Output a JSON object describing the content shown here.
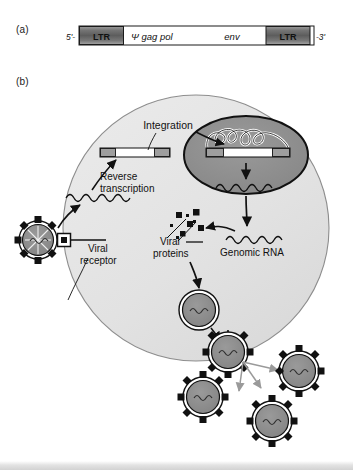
{
  "figure": {
    "panels": [
      {
        "id": "a",
        "label": "(a)",
        "caption_type": "provirus-genome-map"
      },
      {
        "id": "b",
        "label": "(b)",
        "caption_type": "retroviral-life-cycle"
      }
    ]
  },
  "genome_map": {
    "five_prime": "5'-",
    "three_prime": "-3'",
    "segments": [
      {
        "name": "ltr-left",
        "label": "LTR",
        "style": "gradient-gray"
      },
      {
        "name": "coding-region",
        "label": "",
        "style": "white"
      },
      {
        "name": "ltr-right",
        "label": "LTR",
        "style": "gradient-gray"
      }
    ],
    "gene_labels": [
      {
        "name": "psi-gag-pol",
        "text": "Ψ gag pol"
      },
      {
        "name": "env",
        "text": "env"
      }
    ]
  },
  "life_cycle": {
    "labels": {
      "integration": "Integration",
      "reverse_transcription_line1": "Reverse",
      "reverse_transcription_line2": "transcription",
      "viral_receptor_line1": "Viral",
      "viral_receptor_line2": "receptor",
      "viral_proteins_line1": "Viral",
      "viral_proteins_line2": "proteins",
      "genomic_rna": "Genomic RNA"
    },
    "structures": {
      "cell": "host-cell",
      "nucleus": "nucleus",
      "chromatin": "host-chromosome",
      "provirus": "integrated-provirus",
      "cytoplasmic_dna": "viral-dna",
      "free_virions_count": 3,
      "budding_virions_count": 2,
      "entering_virion_count": 1
    }
  },
  "colors": {
    "cell_fill": "#e3e3e3",
    "nucleus_fill": "#8f8f8f",
    "virion_core": "#8f8f8f",
    "ltr_dark": "#6d6d6d",
    "outline": "#1a1a1a",
    "dispersal_arrow": "#9a9a9a",
    "page_background": "#ffffff"
  }
}
